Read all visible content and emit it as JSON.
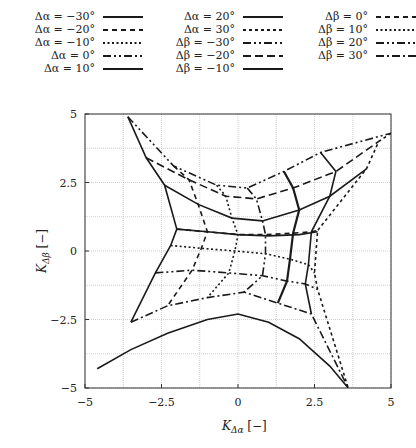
{
  "chart_data": {
    "type": "line",
    "title": "",
    "xlabel": "K_{Δα} [−]",
    "ylabel": "K_{Δβ} [−]",
    "xlim": [
      -5,
      5
    ],
    "ylim": [
      -5,
      5
    ],
    "xticks": [
      "−5",
      "−2.5",
      "0",
      "2.5",
      "5"
    ],
    "yticks": [
      "5",
      "2.5",
      "0",
      "−2.5",
      "−5"
    ],
    "grid": true,
    "legend_position": "top (3 columns)",
    "alpha_values": [
      -30,
      -20,
      -10,
      0,
      10,
      20,
      30
    ],
    "beta_values": [
      -30,
      -20,
      -10,
      0,
      10,
      20,
      30
    ],
    "nodes_note": "nodes[i_beta][j_alpha] = [K_Δα, K_Δβ]",
    "nodes": [
      [
        [
          -3.6,
          4.9
        ],
        [
          -2.1,
          3.1
        ],
        [
          -0.7,
          2.4
        ],
        [
          0.3,
          2.3
        ],
        [
          1.5,
          2.9
        ],
        [
          2.7,
          3.6
        ],
        [
          5.0,
          4.3
        ]
      ],
      [
        [
          -3.0,
          3.4
        ],
        [
          -1.6,
          2.6
        ],
        [
          -0.4,
          2.0
        ],
        [
          0.6,
          1.9
        ],
        [
          1.8,
          2.3
        ],
        [
          3.2,
          2.9
        ],
        [
          4.6,
          4.0
        ]
      ],
      [
        [
          -2.4,
          2.4
        ],
        [
          -1.3,
          1.7
        ],
        [
          -0.2,
          1.2
        ],
        [
          0.8,
          1.1
        ],
        [
          2.0,
          1.5
        ],
        [
          3.0,
          2.0
        ],
        [
          4.2,
          3.0
        ]
      ],
      [
        [
          -2.0,
          0.8
        ],
        [
          -1.0,
          0.7
        ],
        [
          0.0,
          0.6
        ],
        [
          0.9,
          0.6
        ],
        [
          1.8,
          0.65
        ],
        [
          2.4,
          0.7
        ],
        [
          2.6,
          0.75
        ]
      ],
      [
        [
          -2.2,
          0.2
        ],
        [
          -1.2,
          0.1
        ],
        [
          -0.1,
          0.0
        ],
        [
          0.9,
          -0.1
        ],
        [
          1.7,
          -0.3
        ],
        [
          2.3,
          -0.5
        ],
        [
          2.5,
          -0.8
        ]
      ],
      [
        [
          -2.7,
          -0.8
        ],
        [
          -1.5,
          -0.7
        ],
        [
          -0.3,
          -0.8
        ],
        [
          0.8,
          -0.9
        ],
        [
          1.6,
          -1.1
        ],
        [
          2.2,
          -1.2
        ],
        [
          2.6,
          -1.4
        ]
      ],
      [
        [
          -3.5,
          -2.6
        ],
        [
          -2.3,
          -2.0
        ],
        [
          -1.0,
          -1.7
        ],
        [
          0.2,
          -1.5
        ],
        [
          1.3,
          -1.9
        ],
        [
          2.4,
          -2.3
        ],
        [
          3.6,
          -5.0
        ]
      ]
    ],
    "series": [
      {
        "name": "Δα = −30°",
        "style": "solid"
      },
      {
        "name": "Δα = −20°",
        "style": "dashed"
      },
      {
        "name": "Δα = −10°",
        "style": "dotted"
      },
      {
        "name": "Δα = 0°",
        "style": "dash-dot-dot"
      },
      {
        "name": "Δα = 10°",
        "style": "solid-thick"
      },
      {
        "name": "Δα = 20°",
        "style": "solid"
      },
      {
        "name": "Δα = 30°",
        "style": "short-dashed"
      },
      {
        "name": "Δβ = −30°",
        "style": "dash-dot-dot"
      },
      {
        "name": "Δβ = −20°",
        "style": "long-dashed"
      },
      {
        "name": "Δβ = −10°",
        "style": "solid"
      },
      {
        "name": "Δβ = 0°",
        "style": "dashed"
      },
      {
        "name": "Δβ = 10°",
        "style": "dotted"
      },
      {
        "name": "Δβ = 20°",
        "style": "dash-dot-dot"
      },
      {
        "name": "Δβ = 30°",
        "style": "dash-dot"
      }
    ],
    "boundary_curves": {
      "bottom_solid": [
        [
          -4.6,
          -4.3
        ],
        [
          -3.5,
          -3.6
        ],
        [
          -2.3,
          -3.0
        ],
        [
          -1.0,
          -2.5
        ],
        [
          0.0,
          -2.3
        ],
        [
          1.0,
          -2.6
        ],
        [
          2.0,
          -3.2
        ],
        [
          3.0,
          -4.2
        ],
        [
          3.6,
          -5.0
        ]
      ],
      "mid_solid": [
        [
          -2.0,
          0.8
        ],
        [
          -1.0,
          0.7
        ],
        [
          0.0,
          0.6
        ],
        [
          1.0,
          0.55
        ],
        [
          2.0,
          0.6
        ],
        [
          2.6,
          0.7
        ]
      ]
    }
  },
  "legend": {
    "col1": [
      "Δα = −30°",
      "Δα = −20°",
      "Δα = −10°",
      "Δα = 0°",
      "Δα = 10°"
    ],
    "col2": [
      "Δα = 20°",
      "Δα = 30°",
      "Δβ = −30°",
      "Δβ = −20°",
      "Δβ = −10°"
    ],
    "col3": [
      "Δβ = 0°",
      "Δβ = 10°",
      "Δβ = 20°",
      "Δβ = 30°"
    ]
  },
  "axes": {
    "xlabel": "K",
    "xlabel_sub": "Δα",
    "xlabel_unit": "[−]",
    "ylabel": "K",
    "ylabel_sub": "Δβ",
    "ylabel_unit": "[−]"
  }
}
